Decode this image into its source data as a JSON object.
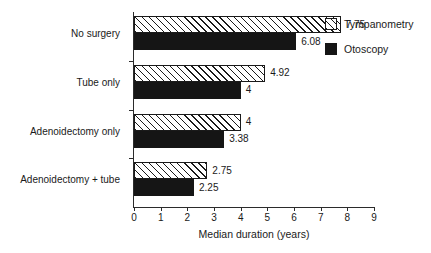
{
  "chart_data": {
    "type": "bar",
    "orientation": "horizontal",
    "title": "",
    "xlabel": "Median duration (years)",
    "ylabel": "",
    "xlim": [
      0,
      9
    ],
    "xticks": [
      0,
      1,
      2,
      3,
      4,
      5,
      6,
      7,
      8,
      9
    ],
    "xticklabels": [
      "0",
      "1",
      "2",
      "3",
      "4",
      "5",
      "6",
      "7",
      "8",
      "9"
    ],
    "grid": false,
    "legend_position": "top-right",
    "categories": [
      "No surgery",
      "Tube only",
      "Adenoidectomy only",
      "Adenoidectomy + tube"
    ],
    "series": [
      {
        "name": "Tympanometry",
        "values": [
          7.75,
          4.92,
          4,
          2.75
        ],
        "labels": [
          "7.75",
          "4.92",
          "4",
          "2.75"
        ],
        "fill": "hatched",
        "color": "#ffffff",
        "edgecolor": "#1a1a1a"
      },
      {
        "name": "Otoscopy",
        "values": [
          6.08,
          4,
          3.38,
          2.25
        ],
        "labels": [
          "6.08",
          "4",
          "3.38",
          "2.25"
        ],
        "fill": "solid",
        "color": "#151515",
        "edgecolor": "#151515"
      }
    ]
  },
  "legend": {
    "items": [
      {
        "label": "Tympanometry",
        "swatch": "hatched-swatch-icon"
      },
      {
        "label": "Otoscopy",
        "swatch": "solid-swatch-icon"
      }
    ]
  },
  "axis": {
    "x_title": "Median duration (years)"
  }
}
